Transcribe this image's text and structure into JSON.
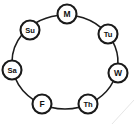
{
  "diagram": {
    "type": "cycle-graph",
    "background_color": "#ffffff",
    "stroke_color": "#1a1a1a",
    "node_fill_color": "#ffffff",
    "canvas": {
      "width": 134,
      "height": 124
    },
    "ring": {
      "center_x": 65,
      "center_y": 62,
      "radius_x": 53,
      "radius_y": 47,
      "node_radius": 9.5
    },
    "nodes": [
      {
        "id": "monday",
        "label": "M",
        "cx": 67,
        "cy": 14,
        "order": 1
      },
      {
        "id": "tuesday",
        "label": "Tu",
        "cx": 108,
        "cy": 34,
        "order": 2
      },
      {
        "id": "wednesday",
        "label": "W",
        "cx": 118,
        "cy": 73,
        "order": 3
      },
      {
        "id": "thursday",
        "label": "Th",
        "cx": 88,
        "cy": 104,
        "order": 4
      },
      {
        "id": "friday",
        "label": "F",
        "cx": 42,
        "cy": 104,
        "order": 5
      },
      {
        "id": "saturday",
        "label": "Sa",
        "cx": 12,
        "cy": 70,
        "order": 6
      },
      {
        "id": "sunday",
        "label": "Su",
        "cx": 30,
        "cy": 30,
        "order": 7
      }
    ],
    "edges": [
      {
        "from": "monday",
        "to": "tuesday"
      },
      {
        "from": "tuesday",
        "to": "wednesday"
      },
      {
        "from": "wednesday",
        "to": "thursday"
      },
      {
        "from": "thursday",
        "to": "friday"
      },
      {
        "from": "friday",
        "to": "saturday"
      },
      {
        "from": "saturday",
        "to": "sunday"
      },
      {
        "from": "sunday",
        "to": "monday"
      }
    ]
  }
}
